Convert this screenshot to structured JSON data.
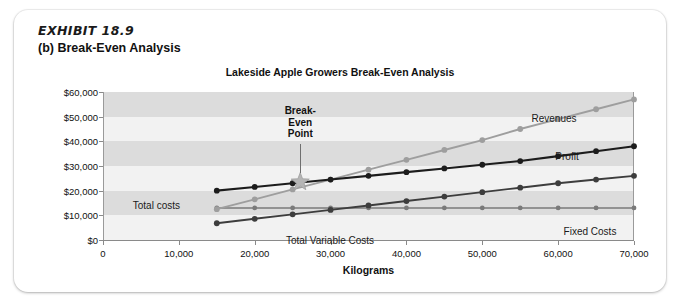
{
  "exhibit": {
    "number": "EXHIBIT 18.9",
    "subtitle": "(b) Break-Even Analysis"
  },
  "chart_data": {
    "type": "line",
    "title": "Lakeside Apple Growers Break-Even Analysis",
    "xlabel": "Kilograms",
    "ylabel": "",
    "xlim": [
      0,
      70000
    ],
    "ylim": [
      0,
      60000
    ],
    "grid": true,
    "grid_style": "alternating-horizontal-bands",
    "legend_position": "inline-labels",
    "x_tick_labels": [
      "0",
      "10,000",
      "20,000",
      "30,000",
      "40,000",
      "50,000",
      "60,000",
      "70,000"
    ],
    "x_ticks": [
      0,
      10000,
      20000,
      30000,
      40000,
      50000,
      60000,
      70000
    ],
    "y_tick_labels": [
      "$0",
      "$10,000",
      "$20,000",
      "$30,000",
      "$40,000",
      "$50,000",
      "$60,000"
    ],
    "y_ticks": [
      0,
      10000,
      20000,
      30000,
      40000,
      50000,
      60000
    ],
    "x": [
      15000,
      20000,
      25000,
      30000,
      35000,
      40000,
      45000,
      50000,
      55000,
      60000,
      65000,
      70000
    ],
    "series": [
      {
        "name": "Revenues",
        "color": "#9e9e9e",
        "values": [
          12500,
          16500,
          20500,
          24500,
          28500,
          32500,
          36500,
          40500,
          45000,
          49000,
          53000,
          57000
        ]
      },
      {
        "name": "Profit",
        "color": "#1c1c1c",
        "values": [
          20000,
          21500,
          23000,
          24500,
          26000,
          27500,
          29000,
          30500,
          32000,
          34000,
          36000,
          38000
        ]
      },
      {
        "name": "Total costs",
        "color": "#1c1c1c",
        "values": [
          20000,
          21500,
          23000,
          24500,
          26000,
          27500,
          29000,
          30500,
          32000,
          34000,
          36000,
          38000
        ]
      },
      {
        "name": "Total Variable Costs",
        "color": "#3d3d3d",
        "values": [
          6800,
          8600,
          10400,
          12200,
          14000,
          15800,
          17600,
          19400,
          21200,
          23000,
          24500,
          26000
        ]
      },
      {
        "name": "Fixed Costs",
        "color": "#7a7a7a",
        "values": [
          13000,
          13000,
          13000,
          13000,
          13000,
          13000,
          13000,
          13000,
          13000,
          13000,
          13000,
          13000
        ]
      }
    ],
    "annotations": [
      {
        "name": "break-even-point",
        "text_lines": [
          "Break-",
          "Even",
          "Point"
        ],
        "marker": "star",
        "marker_color": "#b5b5b5",
        "x": 26000,
        "y": 23500
      }
    ],
    "series_labels": [
      {
        "name": "Revenues",
        "text": "Revenues"
      },
      {
        "name": "Profit",
        "text": "Profit"
      },
      {
        "name": "Total costs",
        "text": "Total costs"
      },
      {
        "name": "Total Variable Costs",
        "text": "Total Variable Costs"
      },
      {
        "name": "Fixed Costs",
        "text": "Fixed Costs"
      }
    ]
  }
}
